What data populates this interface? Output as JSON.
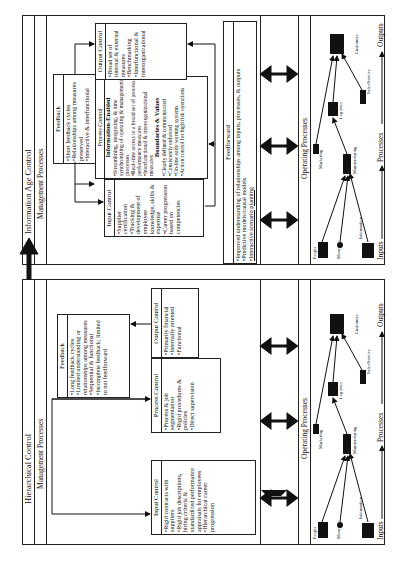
{
  "left_panel": {
    "title": "Hierarchical Control",
    "management_label": "Management Processes",
    "feedback": {
      "heading": "Feedback",
      "items": [
        "Long feedback cycles",
        "Limited understanding or relationships among measures",
        "Sequential & functional",
        "Incomplete feedback; limited to not feedforward"
      ]
    },
    "input_control": {
      "heading": "Input Control",
      "items": [
        "Rigid contracts with suppliers",
        "Rigid job descriptions, hiring criteria & standardized performance appraisals for employees",
        "Hierarchical career progression"
      ]
    },
    "process_control": {
      "heading": "Process Control",
      "items": [
        "Process & job segmentation",
        "Rigid procedures & policies",
        "Direct supervision"
      ]
    },
    "output_control": {
      "heading": "Output Control",
      "items": [
        "Primarily financial",
        "Internally oriented",
        "Functional"
      ]
    },
    "operating_label": "Operating Processes"
  },
  "right_panel": {
    "title": "Information Age Control",
    "management_label": "Management Processes",
    "feedback": {
      "heading": "Feedback",
      "items": [
        "Short feedback cycles",
        "Relationships among measures preserved",
        "Interactive & interfunctional"
      ]
    },
    "input_control": {
      "heading": "Input Control",
      "items": [
        "Supplier certification",
        "Tracking & development of employee knowledge, skills & expertise",
        "Career progression based on competencies"
      ]
    },
    "process_control": {
      "heading": "Process Control",
      "sub1": "Information-Enabled",
      "items1": [
        "Streamlining, integrating, & time synchronizing of operating & management processes",
        "Real-time access to a broad set of process performance measures",
        "Interfunctional & interorganizational measures"
      ],
      "sub2": "Boundaries & Values",
      "items2": [
        "Clearly defined & communicated",
        "Consistently enforced",
        "On-line early warning systems",
        "Action control for high risk operations"
      ]
    },
    "output_control": {
      "heading": "Output Control",
      "items": [
        "Broad set of internal & external measures",
        "Benchmarking",
        "Interfunctional & interorganizational"
      ]
    },
    "feedforward": {
      "heading": "Feedforward",
      "items": [
        "Improved understanding of relationships among inputs, processes, & outputs",
        "Predictive models/causal models",
        "Interactive scenario planning"
      ]
    },
    "operating_label": "Operating Processes"
  },
  "operating": {
    "nodes": [
      "People",
      "Money",
      "Information",
      "Manufacturing",
      "Marketing",
      "Logistics",
      "Sales/Service",
      "Customers"
    ],
    "flow": [
      "Inputs",
      "Processes",
      "Outputs"
    ]
  },
  "icons": [
    "double-arrow-icon",
    "up-arrow-icon",
    "people-icon",
    "money-icon",
    "information-icon",
    "factory-icon",
    "marketing-icon",
    "logistics-icon",
    "sales-service-icon",
    "customers-icon"
  ]
}
